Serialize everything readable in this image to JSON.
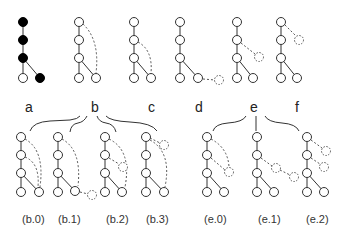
{
  "colors": {
    "edge": "#333333",
    "node_fill": "#ffffff",
    "node_filled": "#000000",
    "dashed": "#555555"
  },
  "top_trees": [
    {
      "id": "t0",
      "x": 23,
      "filled": true
    },
    {
      "id": "t1",
      "x": 79
    },
    {
      "id": "t2",
      "x": 134
    },
    {
      "id": "t3",
      "x": 180
    },
    {
      "id": "t4",
      "x": 237
    },
    {
      "id": "t5",
      "x": 281
    }
  ],
  "group_labels": [
    {
      "id": "a",
      "text": "a",
      "x": 25,
      "y": 100
    },
    {
      "id": "b",
      "text": "b",
      "x": 91,
      "y": 100
    },
    {
      "id": "c",
      "text": "c",
      "x": 148,
      "y": 100
    },
    {
      "id": "d",
      "text": "d",
      "x": 195,
      "y": 100
    },
    {
      "id": "e",
      "text": "e",
      "x": 250,
      "y": 100
    },
    {
      "id": "f",
      "text": "f",
      "x": 295,
      "y": 100
    }
  ],
  "captions": [
    {
      "id": "b0",
      "text": "(b.0)",
      "x": 22,
      "y": 214
    },
    {
      "id": "b1",
      "text": "(b.1)",
      "x": 58,
      "y": 214
    },
    {
      "id": "b2",
      "text": "(b.2)",
      "x": 106,
      "y": 214
    },
    {
      "id": "b3",
      "text": "(b.3)",
      "x": 146,
      "y": 214
    },
    {
      "id": "e0",
      "text": "(e.0)",
      "x": 204,
      "y": 214
    },
    {
      "id": "e1",
      "text": "(e.1)",
      "x": 258,
      "y": 214
    },
    {
      "id": "e2",
      "text": "(e.2)",
      "x": 306,
      "y": 214
    }
  ]
}
